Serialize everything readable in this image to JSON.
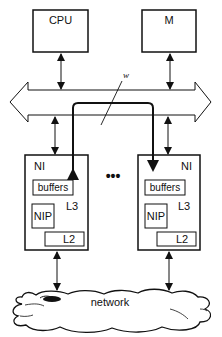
{
  "diagram": {
    "nodes": {
      "cpu": {
        "label": "CPU"
      },
      "memory": {
        "label": "M"
      },
      "bus": {
        "label": "w"
      },
      "ni_left": {
        "label": "NI",
        "buffers": "buffers",
        "nip": "NIP",
        "l3": "L3",
        "l2": "L2"
      },
      "ni_right": {
        "label": "NI",
        "buffers": "buffers",
        "nip": "NIP",
        "l3": "L3",
        "l2": "L2"
      },
      "ellipsis": {
        "label": "•••"
      },
      "network": {
        "label": "network"
      }
    },
    "edges": [
      {
        "from": "cpu",
        "to": "bus",
        "type": "bidirectional"
      },
      {
        "from": "memory",
        "to": "bus",
        "type": "bidirectional"
      },
      {
        "from": "bus",
        "to": "ni_left",
        "type": "bidirectional"
      },
      {
        "from": "bus",
        "to": "ni_right",
        "type": "bidirectional"
      },
      {
        "from": "ni_left",
        "to": "network",
        "type": "bidirectional"
      },
      {
        "from": "ni_right",
        "to": "network",
        "type": "bidirectional"
      },
      {
        "from": "ni_left",
        "to": "ni_right",
        "type": "bold-path-via-bus",
        "label": "w"
      }
    ]
  }
}
